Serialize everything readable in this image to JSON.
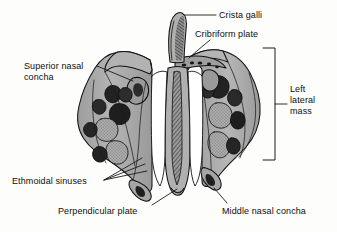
{
  "figure": {
    "view": "posterior view",
    "background_color": "#fdfdfc",
    "bone_fill_color": "#a9a9a9",
    "bone_fill_light": "#bdbdbd",
    "bone_fill_dark": "#8c8c8c",
    "cavity_color": "#1a1a1a",
    "outline_color": "#111111",
    "leader_color": "#1a1a1a",
    "text_color": "#0d0d0d"
  },
  "labels": [
    {
      "id": "crista_galli",
      "text": "Crista galli",
      "lines": [
        "Crista galli"
      ]
    },
    {
      "id": "cribriform_plate",
      "text": "Cribriform plate",
      "lines": [
        "Cribriform plate"
      ]
    },
    {
      "id": "superior_nasal_concha",
      "text": "Superior nasal concha",
      "lines": [
        "Superior nasal",
        "concha"
      ]
    },
    {
      "id": "left_lateral_mass",
      "text": "Left lateral mass",
      "lines": [
        "Left",
        "lateral",
        "mass"
      ]
    },
    {
      "id": "ethmoidal_sinuses",
      "text": "Ethmoidal sinuses",
      "lines": [
        "Ethmoidal sinuses"
      ]
    },
    {
      "id": "perpendicular_plate",
      "text": "Perpendicular plate",
      "lines": [
        "Perpendicular plate"
      ]
    },
    {
      "id": "middle_nasal_concha",
      "text": "Middle nasal concha",
      "lines": [
        "Middle nasal concha"
      ]
    }
  ],
  "label_text": {
    "crista_galli": "Crista galli",
    "cribriform_plate": "Cribriform plate",
    "superior_nasal_concha": "Superior nasal\nconcha",
    "left_lateral_mass": "Left\nlateral\nmass",
    "ethmoidal_sinuses": "Ethmoidal sinuses",
    "perpendicular_plate": "Perpendicular plate",
    "middle_nasal_concha": "Middle nasal concha"
  },
  "annotations": {
    "bracket": {
      "name": "left-lateral-mass-bracket",
      "orientation": "vertical",
      "x": 275,
      "y_top": 48,
      "y_bottom": 160,
      "tick_y": 104,
      "arm_length": 12
    },
    "leaders": {
      "crista_galli": {
        "from": [
          216,
          15
        ],
        "to": [
          185,
          15
        ]
      },
      "cribriform_plate": {
        "from": [
          210,
          40
        ],
        "to": [
          188,
          57
        ]
      },
      "superior_nasal_concha": {
        "from": [
          97,
          66
        ],
        "to": [
          133,
          80
        ]
      },
      "ethmoidal_sinuses": {
        "from": [
          104,
          180
        ],
        "targets": [
          [
            141,
            159
          ],
          [
            144,
            164
          ],
          [
            146,
            170
          ]
        ]
      },
      "perpendicular_plate": {
        "from": [
          152,
          205
        ],
        "to": [
          176,
          189
        ]
      },
      "middle_nasal_concha": {
        "from": [
          227,
          203
        ],
        "to": [
          213,
          188
        ]
      }
    }
  }
}
